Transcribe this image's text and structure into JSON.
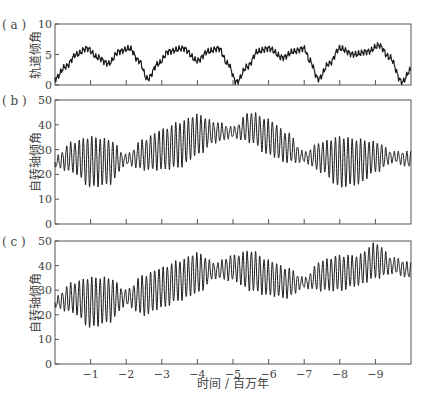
{
  "chart_data": [
    {
      "id": "a",
      "type": "line",
      "panel_label": "( a )",
      "ylabel": "轨道倾角",
      "xlabel": "",
      "ylim": [
        0,
        10
      ],
      "yticks": [
        0,
        5,
        10
      ],
      "xlim": [
        0,
        -10
      ],
      "xticks": [
        -1,
        -2,
        -3,
        -4,
        -5,
        -6,
        -7,
        -8,
        -9
      ],
      "xticklabels_shown": false,
      "grid": false,
      "description": "Orbital inclination oscillating 0–7 deg with ~2.4 Myr cycle and ~1.2 Myr sub-peaks",
      "envelope_points": {
        "t": [
          0,
          -0.3,
          -0.6,
          -0.9,
          -1.2,
          -1.5,
          -1.8,
          -2.1,
          -2.35,
          -2.6,
          -2.9,
          -3.2,
          -3.6,
          -4.0,
          -4.3,
          -4.6,
          -4.85,
          -5.1,
          -5.4,
          -5.7,
          -6.0,
          -6.4,
          -6.7,
          -7.0,
          -7.15,
          -7.4,
          -7.7,
          -8.0,
          -8.4,
          -8.8,
          -9.1,
          -9.4,
          -9.75,
          -10.0
        ],
        "value": [
          1.0,
          3.0,
          5.0,
          6.0,
          4.5,
          3.5,
          5.5,
          6.0,
          4.0,
          1.0,
          3.5,
          5.5,
          6.0,
          4.0,
          5.5,
          6.0,
          3.5,
          0.5,
          3.0,
          5.5,
          6.0,
          4.5,
          5.5,
          6.0,
          4.0,
          1.0,
          3.5,
          6.0,
          5.0,
          5.5,
          6.5,
          4.5,
          0.5,
          2.5
        ]
      },
      "color": "#1a1a1a"
    },
    {
      "id": "b",
      "type": "line",
      "panel_label": "( b )",
      "ylabel": "自转轴倾角",
      "xlabel": "",
      "ylim": [
        0,
        50
      ],
      "yticks": [
        0,
        10,
        20,
        30,
        40,
        50
      ],
      "xlim": [
        0,
        -10
      ],
      "xticks": [
        -1,
        -2,
        -3,
        -4,
        -5,
        -6,
        -7,
        -8,
        -9
      ],
      "xticklabels_shown": false,
      "grid": false,
      "description": "Obliquity with fast ~0.12 Myr oscillation; envelope mean/amplitude (deg)",
      "envelope_points": {
        "t": [
          0,
          -0.5,
          -1,
          -1.5,
          -2,
          -2.5,
          -3,
          -3.5,
          -4,
          -4.5,
          -5,
          -5.5,
          -6,
          -6.5,
          -7,
          -7.5,
          -8,
          -8.5,
          -9,
          -9.5,
          -10
        ],
        "mean": [
          25,
          27,
          25,
          25,
          26,
          28,
          30,
          32,
          36,
          37,
          37,
          39,
          35,
          31,
          27,
          27,
          25,
          25,
          27,
          27,
          26
        ],
        "amplitude": [
          2,
          6,
          10,
          9,
          2,
          6,
          8,
          9,
          8,
          4,
          2,
          6,
          7,
          6,
          2,
          6,
          10,
          9,
          6,
          2,
          3
        ]
      },
      "color": "#1a1a1a"
    },
    {
      "id": "c",
      "type": "line",
      "panel_label": "( c )",
      "ylabel": "自转轴倾角",
      "xlabel": "时间 / 百万年",
      "ylim": [
        0,
        50
      ],
      "yticks": [
        0,
        10,
        20,
        30,
        40,
        50
      ],
      "xlim": [
        0,
        -10
      ],
      "xticks": [
        -1,
        -2,
        -3,
        -4,
        -5,
        -6,
        -7,
        -8,
        -9
      ],
      "xticklabels_shown": true,
      "grid": false,
      "description": "Obliquity with fast ~0.12 Myr oscillation; envelope mean/amplitude (deg)",
      "envelope_points": {
        "t": [
          0,
          -0.5,
          -1,
          -1.5,
          -2,
          -2.5,
          -3,
          -3.5,
          -4,
          -4.5,
          -5,
          -5.5,
          -6,
          -6.5,
          -7,
          -7.5,
          -8,
          -8.5,
          -9,
          -9.5,
          -10
        ],
        "mean": [
          25,
          27,
          25,
          26,
          27,
          28,
          31,
          34,
          37,
          38,
          39,
          38,
          35,
          33,
          33,
          36,
          37,
          38,
          42,
          40,
          38
        ],
        "amplitude": [
          2,
          6,
          10,
          9,
          3,
          8,
          8,
          8,
          8,
          3,
          5,
          8,
          7,
          6,
          2,
          6,
          7,
          6,
          7,
          3,
          3
        ]
      },
      "color": "#1a1a1a"
    }
  ],
  "layout": {
    "plot_left": 55,
    "plot_right": 411,
    "panels": {
      "a": {
        "top": 24,
        "bottom": 85
      },
      "b": {
        "top": 100,
        "bottom": 224
      },
      "c": {
        "top": 241,
        "bottom": 364
      }
    },
    "xlabel_y": 388,
    "fast_period_myr": 0.118,
    "axis_color": "#555555",
    "text_color": "#444444"
  }
}
